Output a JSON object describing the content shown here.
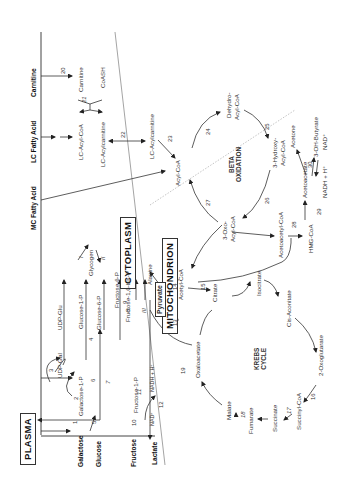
{
  "figure": {
    "orientation": "rotated 90 degrees counter-clockwise",
    "compartments": {
      "plasma": "PLASMA",
      "cytoplasm": "CYTOPLASM",
      "mitochondrion": "MITOCHONDRION"
    },
    "cycles": {
      "beta_oxidation": [
        "BETA",
        "OXIDATION"
      ],
      "krebs": [
        "KREBS",
        "CYCLE"
      ]
    },
    "plasma_substrates": {
      "galactose": "Galactose",
      "glucose": "Glucose",
      "fructose": "Fructose",
      "lactate": "Lactate",
      "mc_fatty_acid": "MC Fatty Acid",
      "lc_fatty_acid": "LC Fatty Acid",
      "carnitine": "Carnitine"
    },
    "metabolites": {
      "udp_gal": "UDP-Gal",
      "galactose_1_p": "Galactose-1-P",
      "udp_glu": "UDP-Glu",
      "glucose_1_p": "Glucose-1-P",
      "glucose_6_p": "Glucose-6-P",
      "glycogen": "Glycogen",
      "fructose_6_p": "Fructose-6-P",
      "fructose_16_bisp": "Fructose-1,6-bis-P",
      "fructose_1_p": "Fructose-1-P",
      "alanine": "Alanine",
      "pyruvate": "Pyruvate",
      "nadh_h_1": "NADH + H⁺",
      "nad_1": "NAD⁺",
      "carnitine_cyt": "Carnitine",
      "coash": "CoASH",
      "lc_acyl_coa": "LC-Acyl-CoA",
      "lc_acylcarnitine_cyt": "LC-Acylcarnitine",
      "lc_acylcarnitine_mit": "LC-Acylcarnitine",
      "acyl_coa": "Acyl-CoA",
      "dehydro_acyl_coa_1": "Dehydro-",
      "dehydro_acyl_coa_2": "Acyl-CoA",
      "hydroxy_acyl_coa_1": "3-Hydroxy-",
      "hydroxy_acyl_coa_2": "Acyl-CoA",
      "oxo_acyl_coa_1": "3-Oxo-",
      "oxo_acyl_coa_2": "Acyl-CoA",
      "acetoacetyl_coa": "Acetoacetyl-CoA",
      "hmg_coa": "HMG-CoA",
      "acetoacetate": "Acetoacetate",
      "acetone": "Acetone",
      "oh_butyrate": "3-OH-Butyrate",
      "nad_2": "NAD⁺",
      "nadh_h_2": "NADH + H⁺",
      "acetyl_coa": "Acetyl-CoA",
      "citrate": "Citrate",
      "isocitrate": "Isocitrate",
      "cis_aconitate": "Cis-Aconitate",
      "oxoglutarate": "2-Oxoglutarate",
      "succinyl_coa": "Succinyl-CoA",
      "succinate": "Succinate",
      "fumarate": "Fumarate",
      "malate": "Malate",
      "oxaloacetate": "Oxaloacetate"
    },
    "reaction_numbers": [
      "1",
      "2",
      "3",
      "4",
      "5",
      "6",
      "7",
      "8",
      "9",
      "10",
      "11",
      "12",
      "13",
      "14",
      "15",
      "16",
      "17",
      "18",
      "19",
      "20",
      "21",
      "22",
      "23",
      "24",
      "25",
      "26",
      "27",
      "28",
      "29",
      "30"
    ],
    "roman_numerals": {
      "i": "I",
      "ii": "II",
      "iii": "III"
    }
  }
}
